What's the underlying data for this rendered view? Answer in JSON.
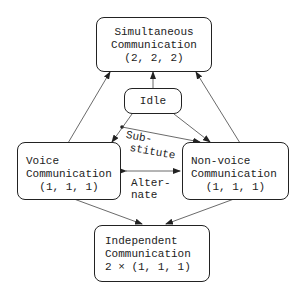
{
  "diagram": {
    "nodes": {
      "simultaneous": {
        "lines": [
          "Simultaneous",
          "Communication",
          "(2, 2, 2)"
        ]
      },
      "idle": {
        "lines": [
          "Idle"
        ]
      },
      "voice": {
        "lines": [
          "Voice",
          "Communication",
          "(1, 1, 1)"
        ]
      },
      "nonvoice": {
        "lines": [
          "Non-voice",
          "Communication",
          "(1, 1, 1)"
        ]
      },
      "independent": {
        "lines": [
          "Independent",
          "Communication",
          "2 × (1, 1, 1)"
        ]
      }
    },
    "edge_labels": {
      "substitute": [
        "Sub-",
        "stitute"
      ],
      "alternate": [
        "Alter-",
        "nate"
      ]
    },
    "edges": [
      {
        "from": "voice",
        "to": "simultaneous"
      },
      {
        "from": "nonvoice",
        "to": "simultaneous"
      },
      {
        "from": "idle",
        "to": "simultaneous"
      },
      {
        "from": "idle",
        "to": "voice"
      },
      {
        "from": "idle",
        "to": "nonvoice"
      },
      {
        "from": "voice",
        "to": "nonvoice",
        "label": "substitute"
      },
      {
        "from": "voice",
        "to": "nonvoice",
        "label": "alternate",
        "bidirectional": true
      },
      {
        "from": "voice",
        "to": "independent"
      },
      {
        "from": "nonvoice",
        "to": "independent"
      }
    ]
  }
}
